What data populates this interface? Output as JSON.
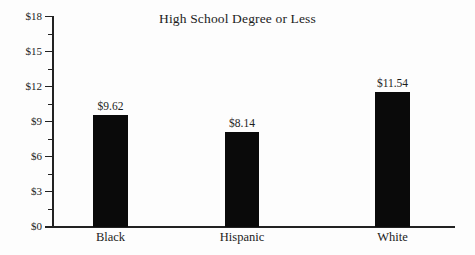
{
  "chart_data": {
    "type": "bar",
    "title": "High School Degree or Less",
    "xlabel": "",
    "ylabel": "",
    "categories": [
      "Black",
      "Hispanic",
      "White"
    ],
    "values": [
      9.62,
      8.14,
      11.54
    ],
    "value_labels": [
      "$9.62",
      "$8.14",
      "$11.54"
    ],
    "ylim": [
      0,
      18
    ],
    "y_major_ticks": [
      0,
      3,
      6,
      9,
      12,
      15,
      18
    ],
    "y_major_tick_labels": [
      "$0",
      "$3",
      "$6",
      "$9",
      "$12",
      "$15",
      "$18"
    ],
    "y_minor_ticks": [
      1.5,
      4.5,
      7.5,
      10.5,
      13.5,
      16.5
    ],
    "grid": false,
    "legend": false,
    "bar_color": "#0a0a0a",
    "axis_color": "#222222",
    "background": "#fdfdfd",
    "value_label_position": "above-bar"
  }
}
